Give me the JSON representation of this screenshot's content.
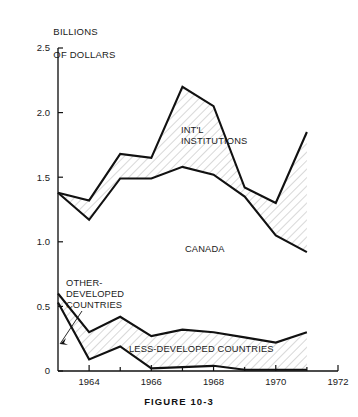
{
  "figure": {
    "caption": "FIGURE 10-3",
    "axis_title": "BILLIONS\nOF DOLLARS"
  },
  "chart_data": {
    "type": "area",
    "title": "FIGURE 10-3",
    "xlabel": "",
    "ylabel": "BILLIONS OF DOLLARS",
    "xlim": [
      1963,
      1972
    ],
    "ylim": [
      0,
      2.5
    ],
    "grid": false,
    "legend": "inline-annotations",
    "x": [
      1963,
      1964,
      1965,
      1966,
      1967,
      1968,
      1969,
      1970,
      1971
    ],
    "xticks": [
      1964,
      1966,
      1968,
      1970,
      1972
    ],
    "xtick_labels": [
      "1964",
      "1966",
      "1968",
      "1970",
      "1972"
    ],
    "yticks": [
      0,
      0.5,
      1.0,
      1.5,
      2.0,
      2.5
    ],
    "ytick_labels": [
      "0",
      "0.5",
      "1.0",
      "1.5",
      "2.0",
      "2.5"
    ],
    "bands": [
      {
        "name": "INT'L INSTITUTIONS",
        "label": "INT'L\nINSTITUTIONS",
        "upper": [
          1.38,
          1.32,
          1.68,
          1.65,
          2.2,
          2.05,
          1.42,
          1.3,
          1.85
        ],
        "lower": [
          1.38,
          1.17,
          1.49,
          1.49,
          1.58,
          1.52,
          1.35,
          1.05,
          0.92
        ]
      },
      {
        "name": "CANADA",
        "label": "CANADA",
        "upper": [
          1.38,
          1.17,
          1.49,
          1.49,
          1.58,
          1.52,
          1.35,
          1.05,
          0.92
        ],
        "lower": [
          0,
          0,
          0,
          0,
          0,
          0,
          0,
          0,
          0
        ]
      },
      {
        "name": "OTHER-DEVELOPED COUNTRIES",
        "label": "OTHER-\nDEVELOPED\nCOUNTRIES",
        "upper": [
          0.6,
          0.3,
          0.42,
          0.27,
          0.32,
          0.3,
          0.26,
          0.22,
          0.3
        ],
        "lower": [
          0.53,
          0.09,
          0.19,
          0.02,
          0.03,
          0.04,
          0.01,
          0.01,
          0.01
        ]
      },
      {
        "name": "LESS-DEVELOPED COUNTRIES",
        "label": "LESS-DEVELOPED COUNTRIES",
        "upper": [
          0.53,
          0.09,
          0.19,
          0.02,
          0.03,
          0.04,
          0.01,
          0.01,
          0.01
        ],
        "lower": [
          0,
          0,
          0,
          0,
          0,
          0,
          0,
          0,
          0
        ]
      }
    ],
    "annotations": [
      {
        "text": "INT'L INSTITUTIONS",
        "x": 1966.4,
        "y": 1.8
      },
      {
        "text": "CANADA",
        "x": 1966.6,
        "y": 1.06
      },
      {
        "text": "OTHER-DEVELOPED COUNTRIES",
        "x": 1963.7,
        "y": 0.62
      },
      {
        "text": "LESS-DEVELOPED COUNTRIES",
        "x": 1966.3,
        "y": 0.13
      }
    ]
  },
  "labels": {
    "intl_institutions_line1": "INT'L",
    "intl_institutions_line2": "INSTITUTIONS",
    "canada": "CANADA",
    "other_developed_line1": "OTHER-",
    "other_developed_line2": "DEVELOPED",
    "other_developed_line3": "COUNTRIES",
    "less_developed": "LESS-DEVELOPED COUNTRIES",
    "axis_title_line1": "BILLIONS",
    "axis_title_line2": "OF DOLLARS"
  }
}
